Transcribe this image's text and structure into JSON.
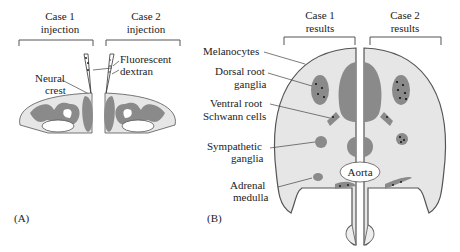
{
  "panelA": {
    "case1": [
      "Case 1",
      "injection"
    ],
    "case2": [
      "Case 2",
      "injection"
    ],
    "fluorescent": [
      "Fluorescent",
      "dextran"
    ],
    "neural": [
      "Neural",
      "crest"
    ],
    "tag": "(A)"
  },
  "panelB": {
    "case1": [
      "Case 1",
      "results"
    ],
    "case2": [
      "Case 2",
      "results"
    ],
    "melanocytes": "Melanocytes",
    "drg": [
      "Dorsal root",
      "ganglia"
    ],
    "vr": [
      "Ventral root",
      "Schwann cells"
    ],
    "symp": [
      "Sympathetic",
      "ganglia"
    ],
    "adrenal": [
      "Adrenal",
      "medulla"
    ],
    "aorta": "Aorta",
    "tag": "(B)"
  },
  "colors": {
    "tissue": "#e6e6e6",
    "dark": "#8a8a8a",
    "line": "#555555"
  }
}
